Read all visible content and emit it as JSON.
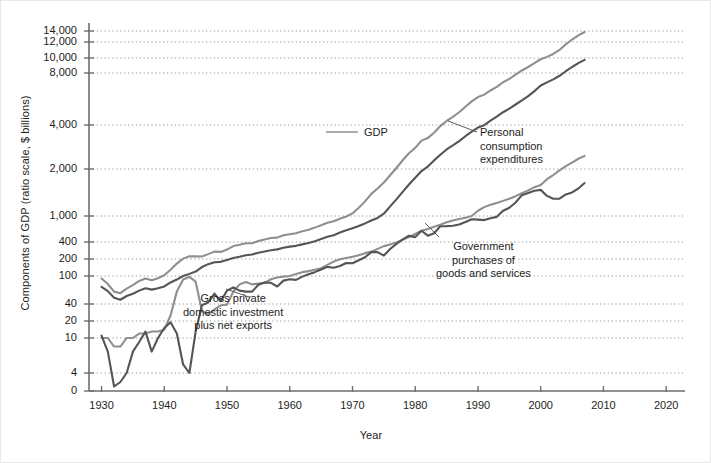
{
  "figure": {
    "background": "#ffffff",
    "xlabel": "Year",
    "ylabel": "Components of GDP (ratio scale, $ billions)"
  },
  "annotations": {
    "gdp": "GDP",
    "pce": "Personal\nconsumption\nexpenditures",
    "government": "Government\npurchases of\ngoods and services",
    "gpdi": "Gross private\ndomestic investment\nplus net exports"
  },
  "colors": {
    "light_line": "#8f8f8f",
    "dark_line": "#555555",
    "axis": "#6e6e6e",
    "grid": "#9a9a9a",
    "text": "#1d1d1d"
  },
  "chart_data": {
    "type": "line",
    "title": "",
    "xlabel": "Year",
    "ylabel": "Components of GDP (ratio scale, $ billions)",
    "yscale": "log",
    "grid": true,
    "legend": "annotations-inline",
    "xlim": [
      1928,
      2023
    ],
    "ylim": [
      0,
      14000
    ],
    "xticks": [
      1930,
      1940,
      1950,
      1960,
      1970,
      1980,
      1990,
      2000,
      2010,
      2020
    ],
    "xticklabels": [
      "1930",
      "1940",
      "1950",
      "1960",
      "1970",
      "1980",
      "1990",
      "2000",
      "2010",
      "2020"
    ],
    "yticks": [
      0,
      4,
      10,
      20,
      40,
      100,
      200,
      400,
      1000,
      2000,
      4000,
      8000,
      10000,
      12000,
      14000
    ],
    "yticklabels": [
      "0",
      "4",
      "10",
      "20",
      "40",
      "100",
      "200",
      "400",
      "1,000",
      "2,000",
      "4,000",
      "8,000",
      "10,000",
      "12,000",
      "14,000"
    ],
    "series": [
      {
        "name": "GDP",
        "color": "#8f8f8f",
        "x": [
          1930,
          1931,
          1932,
          1933,
          1934,
          1935,
          1936,
          1937,
          1938,
          1939,
          1940,
          1941,
          1942,
          1943,
          1944,
          1945,
          1946,
          1947,
          1948,
          1949,
          1950,
          1951,
          1952,
          1953,
          1954,
          1955,
          1956,
          1957,
          1958,
          1959,
          1960,
          1961,
          1962,
          1963,
          1964,
          1965,
          1966,
          1967,
          1968,
          1969,
          1970,
          1971,
          1972,
          1973,
          1974,
          1975,
          1976,
          1977,
          1978,
          1979,
          1980,
          1981,
          1982,
          1983,
          1984,
          1985,
          1986,
          1987,
          1988,
          1989,
          1990,
          1991,
          1992,
          1993,
          1994,
          1995,
          1996,
          1997,
          1998,
          1999,
          2000,
          2001,
          2002,
          2003,
          2004,
          2005,
          2006,
          2007
        ],
        "y": [
          92,
          77,
          60,
          57,
          66,
          74,
          85,
          92,
          87,
          93,
          103,
          129,
          166,
          203,
          224,
          223,
          222,
          244,
          270,
          267,
          294,
          339,
          358,
          379,
          380,
          415,
          438,
          461,
          467,
          507,
          527,
          545,
          586,
          618,
          664,
          720,
          788,
          833,
          910,
          985,
          1039,
          1128,
          1241,
          1386,
          1501,
          1638,
          1825,
          2031,
          2295,
          2563,
          2790,
          3128,
          3255,
          3537,
          3933,
          4220,
          4463,
          4740,
          5104,
          5484,
          5803,
          5996,
          6338,
          6657,
          7072,
          7398,
          7817,
          8304,
          8747,
          9268,
          9817,
          10128,
          10470,
          10961,
          11686,
          12422,
          13178,
          13808
        ]
      },
      {
        "name": "Personal consumption expenditures",
        "color": "#555555",
        "x": [
          1930,
          1931,
          1932,
          1933,
          1934,
          1935,
          1936,
          1937,
          1938,
          1939,
          1940,
          1941,
          1942,
          1943,
          1944,
          1945,
          1946,
          1947,
          1948,
          1949,
          1950,
          1951,
          1952,
          1953,
          1954,
          1955,
          1956,
          1957,
          1958,
          1959,
          1960,
          1961,
          1962,
          1963,
          1964,
          1965,
          1966,
          1967,
          1968,
          1969,
          1970,
          1971,
          1972,
          1973,
          1974,
          1975,
          1976,
          1977,
          1978,
          1979,
          1980,
          1981,
          1982,
          1983,
          1984,
          1985,
          1986,
          1987,
          1988,
          1989,
          1990,
          1991,
          1992,
          1993,
          1994,
          1995,
          1996,
          1997,
          1998,
          1999,
          2000,
          2001,
          2002,
          2003,
          2004,
          2005,
          2006,
          2007
        ],
        "y": [
          70,
          61,
          49,
          46,
          52,
          56,
          62,
          67,
          64,
          67,
          71,
          81,
          89,
          100,
          109,
          120,
          144,
          162,
          175,
          178,
          192,
          208,
          219,
          233,
          240,
          259,
          271,
          286,
          296,
          317,
          331,
          342,
          363,
          383,
          412,
          444,
          481,
          509,
          559,
          604,
          648,
          702,
          770,
          852,
          933,
          1034,
          1152,
          1278,
          1428,
          1592,
          1757,
          1941,
          2077,
          2290,
          2503,
          2720,
          2899,
          3100,
          3353,
          3598,
          3840,
          3986,
          4235,
          4478,
          4743,
          4976,
          5257,
          5547,
          5880,
          6283,
          6768,
          7064,
          7351,
          7709,
          8214,
          8747,
          9269,
          9724
        ]
      },
      {
        "name": "Government purchases of goods and services",
        "color": "#8f8f8f",
        "x": [
          1930,
          1931,
          1932,
          1933,
          1934,
          1935,
          1936,
          1937,
          1938,
          1939,
          1940,
          1941,
          1942,
          1943,
          1944,
          1945,
          1946,
          1947,
          1948,
          1949,
          1950,
          1951,
          1952,
          1953,
          1954,
          1955,
          1956,
          1957,
          1958,
          1959,
          1960,
          1961,
          1962,
          1963,
          1964,
          1965,
          1966,
          1967,
          1968,
          1969,
          1970,
          1971,
          1972,
          1973,
          1974,
          1975,
          1976,
          1977,
          1978,
          1979,
          1980,
          1981,
          1982,
          1983,
          1984,
          1985,
          1986,
          1987,
          1988,
          1989,
          1990,
          1991,
          1992,
          1993,
          1994,
          1995,
          1996,
          1997,
          1998,
          1999,
          2000,
          2001,
          2002,
          2003,
          2004,
          2005,
          2006,
          2007
        ],
        "y": [
          10,
          10,
          8,
          8,
          10,
          10,
          12,
          12,
          13,
          13,
          14,
          25,
          60,
          89,
          97,
          83,
          30,
          26,
          32,
          38,
          39,
          60,
          76,
          82,
          76,
          78,
          80,
          90,
          95,
          98,
          100,
          108,
          117,
          122,
          129,
          137,
          157,
          180,
          198,
          208,
          219,
          234,
          254,
          270,
          302,
          338,
          360,
          394,
          431,
          475,
          531,
          594,
          633,
          685,
          735,
          800,
          855,
          900,
          940,
          1000,
          1080,
          1140,
          1180,
          1210,
          1250,
          1290,
          1340,
          1400,
          1460,
          1530,
          1580,
          1720,
          1830,
          1960,
          2090,
          2210,
          2350,
          2460
        ]
      },
      {
        "name": "Gross private domestic investment plus net exports",
        "color": "#555555",
        "x": [
          1930,
          1931,
          1932,
          1933,
          1934,
          1935,
          1936,
          1937,
          1938,
          1939,
          1940,
          1941,
          1942,
          1943,
          1944,
          1945,
          1946,
          1947,
          1948,
          1949,
          1950,
          1951,
          1952,
          1953,
          1954,
          1955,
          1956,
          1957,
          1958,
          1959,
          1960,
          1961,
          1962,
          1963,
          1964,
          1965,
          1966,
          1967,
          1968,
          1969,
          1970,
          1971,
          1972,
          1973,
          1974,
          1975,
          1976,
          1977,
          1978,
          1979,
          1980,
          1981,
          1982,
          1983,
          1984,
          1985,
          1986,
          1987,
          1988,
          1989,
          1990,
          1991,
          1992,
          1993,
          1994,
          1995,
          1996,
          1997,
          1998,
          1999,
          2000,
          2001,
          2002,
          2003,
          2004,
          2005,
          2006,
          2007
        ],
        "y": [
          11,
          7,
          1,
          2,
          4,
          7,
          9,
          13,
          7,
          10,
          15,
          19,
          12,
          5,
          4,
          13,
          38,
          42,
          56,
          44,
          62,
          69,
          62,
          60,
          60,
          75,
          81,
          80,
          71,
          86,
          90,
          88,
          98,
          107,
          117,
          130,
          145,
          140,
          150,
          170,
          168,
          190,
          215,
          265,
          265,
          230,
          300,
          370,
          440,
          500,
          475,
          595,
          500,
          545,
          695,
          700,
          710,
          740,
          810,
          890,
          880,
          865,
          925,
          970,
          1080,
          1130,
          1220,
          1360,
          1405,
          1450,
          1470,
          1345,
          1290,
          1290,
          1375,
          1415,
          1500,
          1625
        ]
      }
    ]
  }
}
